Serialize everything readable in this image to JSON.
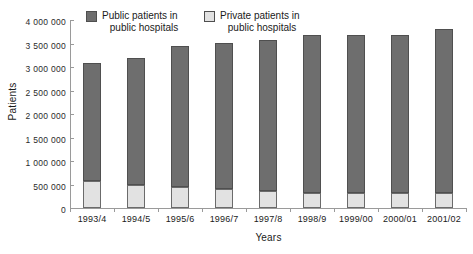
{
  "chart_data": {
    "type": "bar",
    "subtype": "stacked-bar",
    "title": "",
    "xlabel": "Years",
    "ylabel": "Patients",
    "categories": [
      "1993/4",
      "1994/5",
      "1995/6",
      "1996/7",
      "1997/8",
      "1998/9",
      "1999/00",
      "2000/01",
      "2001/02"
    ],
    "series": [
      {
        "name": "Private patients in public hospitals",
        "color": "#e2e2e2",
        "values": [
          575000,
          500000,
          450000,
          400000,
          370000,
          330000,
          330000,
          320000,
          320000
        ]
      },
      {
        "name": "Public patients in public hospitals",
        "color": "#6e6e6e",
        "values": [
          2515000,
          2700000,
          2990000,
          3120000,
          3200000,
          3350000,
          3350000,
          3370000,
          3480000
        ]
      }
    ],
    "totals": [
      3090000,
      3200000,
      3440000,
      3520000,
      3570000,
      3680000,
      3680000,
      3690000,
      3800000
    ],
    "ylim": [
      0,
      4000000
    ],
    "ytick_step": 500000,
    "ytick_labels": [
      "0",
      "500 000",
      "1 000 000",
      "1 500 000",
      "2 000 000",
      "2 500 000",
      "3 000 000",
      "3 500 000",
      "4 000 000"
    ],
    "ytick_values": [
      0,
      500000,
      1000000,
      1500000,
      2000000,
      2500000,
      3000000,
      3500000,
      4000000
    ],
    "grid": false,
    "legend_position": "top-left-inside"
  },
  "legend": {
    "entries": [
      {
        "line1": "Public patients in",
        "line2": "public hospitals",
        "swatch_color": "#6e6e6e"
      },
      {
        "line1": "Private patients in",
        "line2": "public hospitals",
        "swatch_color": "#e2e2e2"
      }
    ]
  },
  "axes": {
    "x_title": "Years",
    "y_title": "Patients"
  },
  "colors": {
    "public": "#6e6e6e",
    "private": "#e2e2e2",
    "axis": "#9a9a9a",
    "bar_outline": "#4f4f4f",
    "background": "#ffffff",
    "text": "#1a1a1a"
  }
}
